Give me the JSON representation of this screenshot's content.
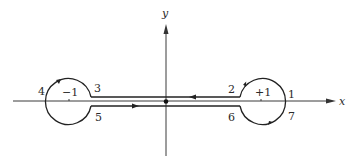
{
  "diagram": {
    "type": "contour-integration-path",
    "axes": {
      "x_label": "x",
      "y_label": "y"
    },
    "poles": [
      {
        "label": "−1",
        "position": "left"
      },
      {
        "label": "+1",
        "position": "right"
      }
    ],
    "point_labels": {
      "p1": "1",
      "p2": "2",
      "p3": "3",
      "p4": "4",
      "p5": "5",
      "p6": "6",
      "p7": "7"
    },
    "colors": {
      "line": "#222222",
      "background": "#ffffff"
    }
  }
}
